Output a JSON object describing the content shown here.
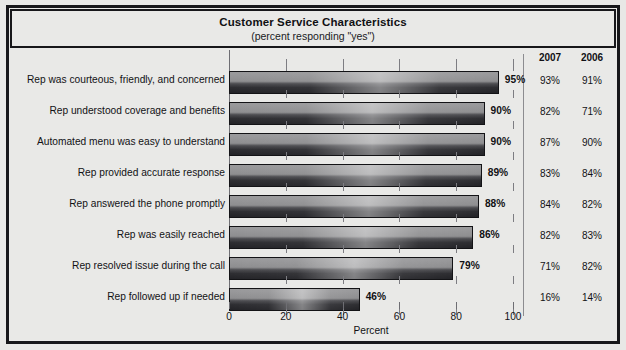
{
  "chart_data": {
    "type": "bar",
    "orientation": "horizontal",
    "title": "Customer Service Characteristics",
    "subtitle": "(percent responding \"yes\")",
    "xlabel": "Percent",
    "ylabel": "",
    "xlim": [
      0,
      100
    ],
    "xticks": [
      0,
      20,
      40,
      60,
      80,
      100
    ],
    "xtick_labels": [
      "0",
      "20",
      "40",
      "60",
      "80",
      "100"
    ],
    "grid": false,
    "legend": "none",
    "categories": [
      "Rep was courteous, friendly, and concerned",
      "Rep understood coverage and benefits",
      "Automated menu was easy to understand",
      "Rep provided accurate response",
      "Rep answered the phone promptly",
      "Rep was easily reached",
      "Rep resolved issue during the call",
      "Rep followed up if needed"
    ],
    "values": [
      95,
      90,
      90,
      89,
      88,
      86,
      79,
      46
    ],
    "value_labels": [
      "95%",
      "90%",
      "90%",
      "89%",
      "88%",
      "86%",
      "79%",
      "46%"
    ],
    "table_columns": [
      "2007",
      "2006"
    ],
    "table_values": [
      [
        "93%",
        "91%"
      ],
      [
        "82%",
        "71%"
      ],
      [
        "87%",
        "90%"
      ],
      [
        "83%",
        "84%"
      ],
      [
        "84%",
        "82%"
      ],
      [
        "82%",
        "83%"
      ],
      [
        "71%",
        "82%"
      ],
      [
        "16%",
        "14%"
      ]
    ],
    "series": [
      {
        "name": "2008",
        "values": [
          95,
          90,
          90,
          89,
          88,
          86,
          79,
          46
        ]
      },
      {
        "name": "2007",
        "values": [
          93,
          82,
          87,
          83,
          84,
          82,
          71,
          16
        ]
      },
      {
        "name": "2006",
        "values": [
          91,
          71,
          90,
          84,
          82,
          83,
          82,
          14
        ]
      }
    ],
    "bar_color": "#8e8e90",
    "bar_edge_color": "#131316",
    "background_color": "#e9e9e7"
  }
}
